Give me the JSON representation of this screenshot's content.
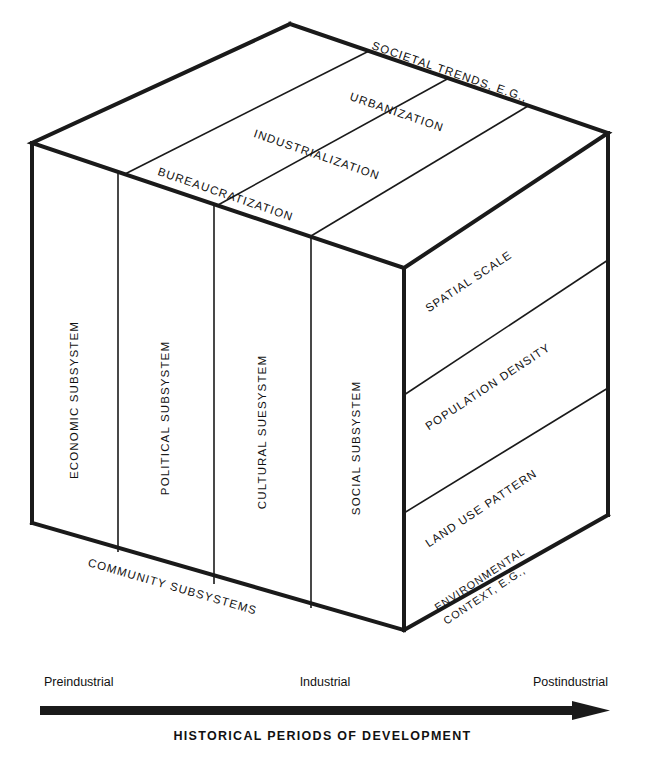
{
  "diagram": {
    "ink_color": "#1a1a1a",
    "background_color": "#ffffff",
    "top_face": {
      "heading": "SOCIETAL TRENDS, E.G.,",
      "bands": [
        {
          "label": "URBANIZATION"
        },
        {
          "label": "INDUSTRIALIZATION"
        },
        {
          "label": "BUREAUCRATIZATION"
        }
      ]
    },
    "front_face": {
      "caption": "COMMUNITY SUBSYSTEMS",
      "columns": [
        {
          "label": "ECONOMIC SUBSYSTEM"
        },
        {
          "label": "POLITICAL SUBSYSTEM"
        },
        {
          "label": "CULTURAL SUESYSTEM"
        },
        {
          "label": "SOCIAL SUBSYSTEM"
        }
      ]
    },
    "right_face": {
      "caption_line1": "ENVIRONMENTAL",
      "caption_line2": "CONTEXT, E.G.,",
      "bands": [
        {
          "label": "SPATIAL SCALE"
        },
        {
          "label": "POPULATION DENSITY"
        },
        {
          "label": "LAND USE PATTERN"
        }
      ]
    },
    "axis": {
      "start_label": "Preindustrial",
      "mid_label": "Industrial",
      "end_label": "Postindustrial",
      "title": "HISTORICAL PERIODS OF DEVELOPMENT"
    }
  }
}
